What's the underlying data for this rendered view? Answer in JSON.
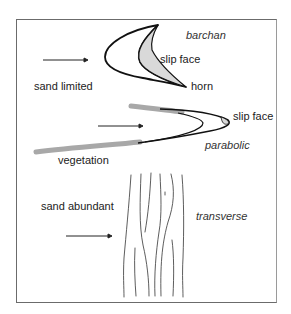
{
  "figure": {
    "labels": {
      "barchan": "barchan",
      "barchan_slip_face": "slip face",
      "horn": "horn",
      "sand_limited": "sand limited",
      "parabolic_slip_face": "slip face",
      "parabolic": "parabolic",
      "vegetation": "vegetation",
      "sand_abundant": "sand abundant",
      "transverse": "transverse"
    },
    "dune_types": [
      {
        "name": "barchan",
        "annotations": [
          "slip face",
          "horn"
        ]
      },
      {
        "name": "parabolic",
        "annotations": [
          "slip face",
          "vegetation"
        ]
      },
      {
        "name": "transverse",
        "annotations": []
      }
    ],
    "gradient": {
      "top": "sand limited",
      "bottom": "sand abundant"
    },
    "wind_arrows": 3,
    "colors": {
      "outline": "#111111",
      "slip_face_fill": "#d9d9d9",
      "vegetation": "#a8a8a8",
      "frame": "#6b6b6b"
    }
  }
}
